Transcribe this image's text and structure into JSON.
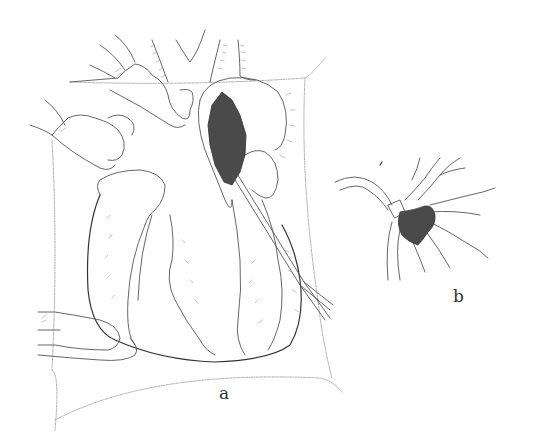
{
  "figure": {
    "panels": [
      {
        "id": "a",
        "label": "a",
        "description": "Surgical view of an opened heart with retractor hands, a draped field, and a dark mass being removed through an atrial incision with an instrument"
      },
      {
        "id": "b",
        "label": "b",
        "description": "Detail of a dark irregular mass with branching vascular attachments"
      }
    ],
    "colors": {
      "background": "#ffffff",
      "line": "#555555",
      "mass_fill": "#4a4a4a",
      "label": "#333333"
    }
  }
}
